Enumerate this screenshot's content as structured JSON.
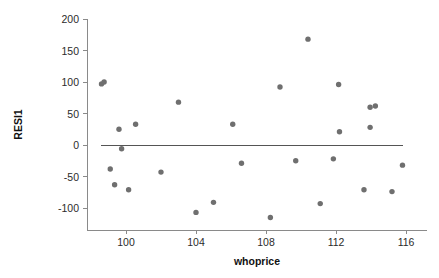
{
  "chart_data": {
    "type": "scatter",
    "title": "",
    "xlabel": "whoprice",
    "ylabel": "RESI1",
    "xlim": [
      98.3,
      116.6
    ],
    "ylim": [
      -130,
      200
    ],
    "grid": false,
    "legend": null,
    "point_color": "#6f6f6f",
    "axis_color": "#8a8a8a",
    "reference_line": {
      "orientation": "horizontal",
      "y": 0,
      "x_start": 98.55,
      "x_end": 115.8,
      "color": "#555555"
    },
    "xticks": [
      100,
      104,
      108,
      112,
      116
    ],
    "xtick_labels": [
      "100",
      "104",
      "108",
      "112",
      "116"
    ],
    "yticks": [
      200,
      150,
      100,
      50,
      0,
      -50,
      -100
    ],
    "ytick_labels": [
      "200",
      "150",
      "100",
      "50",
      "0",
      "-50",
      "-100"
    ],
    "points": [
      {
        "x": 98.6,
        "y": 97
      },
      {
        "x": 98.75,
        "y": 100
      },
      {
        "x": 99.1,
        "y": -38
      },
      {
        "x": 99.35,
        "y": -63
      },
      {
        "x": 99.6,
        "y": 25
      },
      {
        "x": 99.75,
        "y": -6
      },
      {
        "x": 100.15,
        "y": -71
      },
      {
        "x": 100.55,
        "y": 33
      },
      {
        "x": 102.0,
        "y": -43
      },
      {
        "x": 103.0,
        "y": 68
      },
      {
        "x": 104.0,
        "y": -107
      },
      {
        "x": 105.0,
        "y": -91
      },
      {
        "x": 106.1,
        "y": 33
      },
      {
        "x": 106.6,
        "y": -29
      },
      {
        "x": 108.25,
        "y": -115
      },
      {
        "x": 108.8,
        "y": 92
      },
      {
        "x": 109.7,
        "y": -25
      },
      {
        "x": 110.4,
        "y": 168
      },
      {
        "x": 111.1,
        "y": -93
      },
      {
        "x": 111.85,
        "y": -22
      },
      {
        "x": 112.15,
        "y": 96
      },
      {
        "x": 112.2,
        "y": 21
      },
      {
        "x": 113.6,
        "y": -71
      },
      {
        "x": 113.95,
        "y": 28
      },
      {
        "x": 113.95,
        "y": 60
      },
      {
        "x": 114.25,
        "y": 62
      },
      {
        "x": 115.2,
        "y": -74
      },
      {
        "x": 115.8,
        "y": -32
      }
    ]
  }
}
